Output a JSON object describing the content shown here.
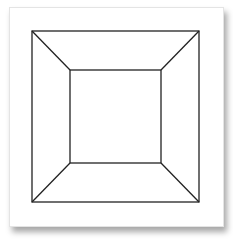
{
  "figure": {
    "stroke_color": "#222222",
    "background": "#ffffff",
    "outer_square": {
      "x1": 32,
      "y1": 31,
      "x2": 199,
      "y2": 202
    },
    "inner_square": {
      "x1": 70,
      "y1": 70,
      "x2": 161,
      "y2": 163
    }
  }
}
